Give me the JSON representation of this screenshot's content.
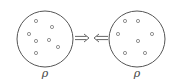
{
  "diagram": {
    "type": "two-system-exchange",
    "stroke_color": "#555555",
    "background": "#ffffff",
    "left_system": {
      "label": "ρ",
      "center": [
        45,
        39
      ],
      "radius": 28,
      "particles": [
        [
          36,
          21
        ],
        [
          52,
          27
        ],
        [
          29,
          34
        ],
        [
          36,
          41
        ],
        [
          49,
          40
        ],
        [
          58,
          47
        ],
        [
          36,
          53
        ]
      ]
    },
    "right_system": {
      "label": "ρ",
      "center": [
        137,
        39
      ],
      "radius": 28,
      "particles": [
        [
          125,
          21
        ],
        [
          138,
          21
        ],
        [
          118,
          34
        ],
        [
          152,
          34
        ],
        [
          138,
          41
        ],
        [
          125,
          53
        ],
        [
          145,
          53
        ]
      ]
    },
    "arrows": [
      {
        "direction": "right",
        "symbol": "⇒",
        "from": [
          75,
          38
        ],
        "to": [
          89,
          38
        ]
      },
      {
        "direction": "left",
        "symbol": "⇐",
        "from": [
          108,
          38
        ],
        "to": [
          94,
          38
        ]
      }
    ]
  }
}
